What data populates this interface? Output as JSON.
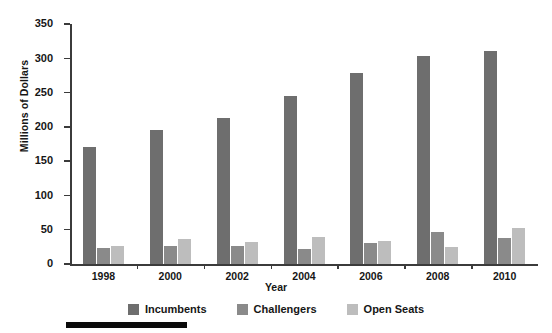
{
  "chart_data": {
    "type": "bar",
    "title": "",
    "xlabel": "Year",
    "ylabel": "Millions of Dollars",
    "categories": [
      "1998",
      "2000",
      "2002",
      "2004",
      "2006",
      "2008",
      "2010"
    ],
    "series": [
      {
        "name": "Incumbents",
        "color": "#6e6e6e",
        "values": [
          171,
          195,
          213,
          245,
          278,
          303,
          311
        ]
      },
      {
        "name": "Challengers",
        "color": "#8a8a8a",
        "values": [
          23,
          27,
          27,
          22,
          31,
          46,
          38
        ]
      },
      {
        "name": "Open Seats",
        "color": "#bdbdbd",
        "values": [
          27,
          36,
          32,
          40,
          34,
          25,
          52
        ]
      }
    ],
    "ylim": [
      0,
      350
    ],
    "yticks": [
      0,
      50,
      100,
      150,
      200,
      250,
      300,
      350
    ],
    "ytick_labels": [
      "0",
      "50",
      "100",
      "150",
      "200",
      "250",
      "300",
      "350"
    ],
    "grid": false,
    "legend_position": "bottom-center"
  },
  "decoration": {
    "bottom_rule_color": "#0a0a0a"
  }
}
